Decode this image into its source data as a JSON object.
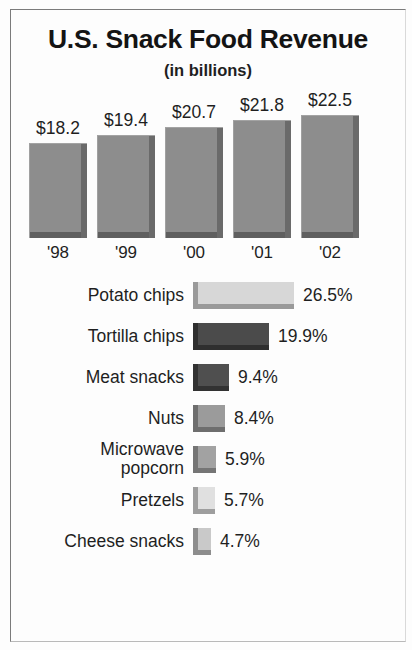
{
  "header": {
    "title": "U.S. Snack Food Revenue",
    "subtitle": "(in billions)"
  },
  "chart_data": [
    {
      "type": "bar",
      "title": "U.S. Snack Food Revenue",
      "subtitle": "(in billions)",
      "xlabel": "",
      "ylabel": "Revenue (billions USD)",
      "orientation": "vertical",
      "grid": false,
      "legend": "none",
      "ylim": [
        0,
        22.5
      ],
      "categories": [
        "'98",
        "'99",
        "'00",
        "'01",
        "'02"
      ],
      "values": [
        18.2,
        19.4,
        20.7,
        21.8,
        22.5
      ],
      "value_labels": [
        "$18.2",
        "$19.4",
        "$20.7",
        "$21.8",
        "$22.5"
      ],
      "bars": [
        {
          "year": "'98",
          "value": 18.2,
          "label": "$18.2",
          "height_px": 95,
          "color": "#8d8d8d"
        },
        {
          "year": "'99",
          "value": 19.4,
          "label": "$19.4",
          "height_px": 103,
          "color": "#8d8d8d"
        },
        {
          "year": "'00",
          "value": 20.7,
          "label": "$20.7",
          "height_px": 111,
          "color": "#8d8d8d"
        },
        {
          "year": "'01",
          "value": 21.8,
          "label": "$21.8",
          "height_px": 118,
          "color": "#8d8d8d"
        },
        {
          "year": "'02",
          "value": 22.5,
          "label": "$22.5",
          "height_px": 123,
          "color": "#8d8d8d"
        }
      ]
    },
    {
      "type": "bar",
      "title": "",
      "xlabel": "Share of snack food market",
      "ylabel": "",
      "orientation": "horizontal",
      "grid": false,
      "legend": "none",
      "xlim": [
        0,
        26.5
      ],
      "categories": [
        "Potato chips",
        "Tortilla chips",
        "Meat snacks",
        "Nuts",
        "Microwave popcorn",
        "Pretzels",
        "Cheese snacks"
      ],
      "values": [
        26.5,
        19.9,
        9.4,
        8.4,
        5.9,
        5.7,
        4.7
      ],
      "value_labels": [
        "26.5%",
        "19.9%",
        "9.4%",
        "8.4%",
        "5.9%",
        "5.7%",
        "4.7%"
      ],
      "bars": [
        {
          "label": "Potato chips",
          "label_lines": [
            "Potato chips"
          ],
          "value": 26.5,
          "pct": "26.5%",
          "width_px": 101,
          "color": "#d7d7d7",
          "edge": "#9a9a9a"
        },
        {
          "label": "Tortilla chips",
          "label_lines": [
            "Tortilla chips"
          ],
          "value": 19.9,
          "pct": "19.9%",
          "width_px": 76,
          "color": "#4b4b4b",
          "edge": "#2f2f2f"
        },
        {
          "label": "Meat snacks",
          "label_lines": [
            "Meat snacks"
          ],
          "value": 9.4,
          "pct": "9.4%",
          "width_px": 36,
          "color": "#4f4f4f",
          "edge": "#323232"
        },
        {
          "label": "Nuts",
          "label_lines": [
            "Nuts"
          ],
          "value": 8.4,
          "pct": "8.4%",
          "width_px": 32,
          "color": "#9b9b9b",
          "edge": "#6e6e6e"
        },
        {
          "label": "Microwave popcorn",
          "label_lines": [
            "Microwave",
            "popcorn"
          ],
          "value": 5.9,
          "pct": "5.9%",
          "width_px": 23,
          "color": "#a2a2a2",
          "edge": "#757575"
        },
        {
          "label": "Pretzels",
          "label_lines": [
            "Pretzels"
          ],
          "value": 5.7,
          "pct": "5.7%",
          "width_px": 22,
          "color": "#e0e0e0",
          "edge": "#9e9e9e"
        },
        {
          "label": "Cheese snacks",
          "label_lines": [
            "Cheese snacks"
          ],
          "value": 4.7,
          "pct": "4.7%",
          "width_px": 18,
          "color": "#c9c9c9",
          "edge": "#8d8d8d"
        }
      ]
    }
  ]
}
